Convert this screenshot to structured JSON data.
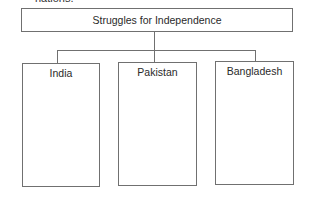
{
  "preceding_text": "nations.",
  "diagram": {
    "title": "Struggles for Independence",
    "columns": [
      {
        "label": "India"
      },
      {
        "label": "Pakistan"
      },
      {
        "label": "Bangladesh"
      }
    ]
  },
  "colors": {
    "border": "#707070",
    "text": "#2a2a2a",
    "background": "#ffffff"
  }
}
